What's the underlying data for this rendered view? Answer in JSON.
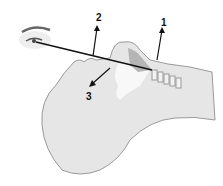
{
  "diagram": {
    "labels": [
      {
        "id": "1",
        "text": "1",
        "x": 161,
        "y": 18
      },
      {
        "id": "2",
        "text": "2",
        "x": 96,
        "y": 13
      },
      {
        "id": "3",
        "text": "3",
        "x": 86,
        "y": 92
      }
    ],
    "colors": {
      "skin": "#e6e6e6",
      "outline": "#9a9a9a",
      "airway": "#b5b5b5",
      "line": "#111111",
      "eye": "#555555"
    }
  }
}
